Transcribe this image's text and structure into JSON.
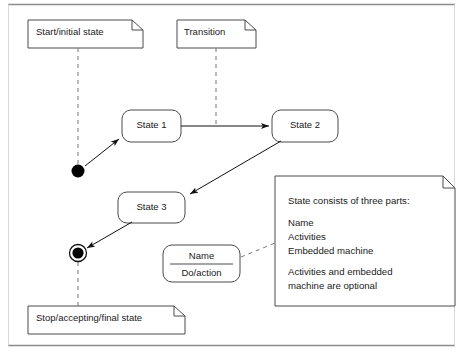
{
  "figure": {
    "type": "uml-state-diagram",
    "title": "",
    "colors": {
      "stroke": "#3a3a3a",
      "rule": "#8c8c8c",
      "text": "#1a1a1a",
      "fill": "#ffffff",
      "marker": "#000000"
    }
  },
  "notes": {
    "start": {
      "label": "Start/initial state"
    },
    "transition": {
      "label": "Transition"
    },
    "stop": {
      "label": "Stop/accepting/final state"
    },
    "state_parts": {
      "heading": "State consists of three parts:",
      "part_1": "Name",
      "part_2": "Activities",
      "part_3": "Embedded machine",
      "footer_line_1": "Activities and embedded",
      "footer_line_2": "machine are optional"
    }
  },
  "states": {
    "state1": {
      "label": "State 1"
    },
    "state2": {
      "label": "State 2"
    },
    "state3": {
      "label": "State 3"
    },
    "sample": {
      "name": "Name",
      "action": "Do/action"
    }
  },
  "markers": {
    "initial": {
      "label": "initial-state-marker"
    },
    "final": {
      "label": "final-state-marker"
    }
  },
  "transitions": [
    {
      "from": "initial",
      "to": "state1",
      "label": ""
    },
    {
      "from": "state1",
      "to": "state2",
      "label": ""
    },
    {
      "from": "state2",
      "to": "state3",
      "label": ""
    },
    {
      "from": "state3",
      "to": "final",
      "label": ""
    }
  ]
}
